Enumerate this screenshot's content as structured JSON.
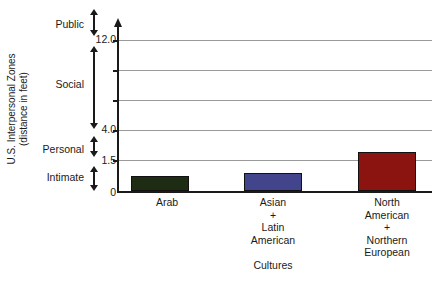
{
  "chart_data": {
    "type": "bar",
    "title": "",
    "subtitle": "",
    "xlabel": "Cultures",
    "ylabel": "U.S. Interpersonal Zones",
    "ylabel_sub": "(distance in feet)",
    "categories": [
      "Arab",
      "Asian + Latin American",
      "North American + Northern European"
    ],
    "category_lines": [
      [
        "Arab"
      ],
      [
        "Asian",
        "+",
        "Latin",
        "American"
      ],
      [
        "North",
        "American",
        "+",
        "Northern",
        "European"
      ]
    ],
    "values": [
      0.7,
      0.85,
      1.9
    ],
    "value_unit": "feet",
    "bar_colors": [
      "#1e2c14",
      "#43458c",
      "#8c1410"
    ],
    "axis_color": "#1a1a1a",
    "grid_color": "#9a9a9a",
    "grid": true,
    "legend": "none",
    "ylim": [
      0,
      14
    ],
    "ytick_labels": [
      "0",
      "1.5",
      "4.0",
      "12.0"
    ],
    "ytick_values": [
      0,
      1.5,
      4.0,
      12.0
    ],
    "gridline_count": 5,
    "axis_note": "non-linear y axis: 0-1.5 expanded, 1.5-12.0 compressed",
    "zones": [
      {
        "name": "Intimate",
        "range_label": "0 to 1.5"
      },
      {
        "name": "Personal",
        "range_label": "1.5 to 4.0"
      },
      {
        "name": "Social",
        "range_label": "4.0 to 12.0"
      },
      {
        "name": "Public",
        "range_label": "12.0 and beyond"
      }
    ]
  }
}
